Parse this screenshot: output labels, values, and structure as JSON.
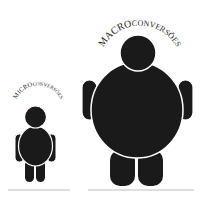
{
  "figures": [
    {
      "id": "small",
      "label_caps": "MICRO",
      "label_rest": "CONVERSÕES",
      "label": "MICROCONVERSÕES"
    },
    {
      "id": "large",
      "label_caps": "MACRO",
      "label_rest": "CONVERSÕES",
      "label": "MACROCONVERSÕES"
    }
  ],
  "colors": {
    "figure": "#1a1a1a",
    "outline": "#ffffff",
    "baseline": "#bdbdbd",
    "text": "#2a2a2a"
  }
}
